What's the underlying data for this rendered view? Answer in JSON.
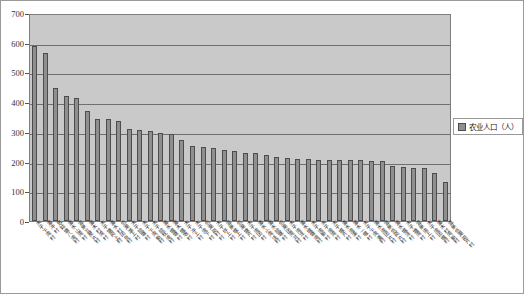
{
  "chart_data": {
    "type": "bar",
    "title": "",
    "xlabel": "",
    "ylabel": "",
    "ylim": [
      0,
      700
    ],
    "ytick_step": 100,
    "yticks": [
      0,
      100,
      200,
      300,
      400,
      500,
      600,
      700
    ],
    "grid": true,
    "legend_position": "right",
    "legend_entries": [
      "农业人口（人）"
    ],
    "series_name": "农业人口（人）",
    "bar_color": "#8f8f8f",
    "plot_background": "#c9c9c9",
    "categories": [
      "木子下湾村",
      "潘冲村",
      "思姑塘八湾村",
      "潘水山湾村",
      "温泉瓦屋片村",
      "潘木村湾村",
      "木子塘岗上村",
      "潘水村团良村",
      "低潮湖上村",
      "木子院塘村",
      "木子下湾新村",
      "木子院枕湾村",
      "潘水堰塘村",
      "潘木堰坂村",
      "木子冲上村",
      "木子湾下村",
      "低潮岗村村",
      "木子坪上村",
      "温泉堰上村",
      "低潮塘片村",
      "木子湾团村",
      "潘水小湾洼村",
      "潘水院塘村",
      "低潮团湾河村",
      "木子湾洼村",
      "潘水堰塘湾村",
      "木子湾新村",
      "木子湾湾村",
      "木子堰片村",
      "潘水湾溪村",
      "潘水一堰村",
      "木子下湾潘村",
      "潘水湾团片村",
      "温泉低岗片村",
      "潘水堰洼村",
      "木子塘湾村",
      "温泉湾上村",
      "木子湾团堰村",
      "潘木村湾新村",
      "温泉低潮岗片村"
    ],
    "values": [
      590,
      565,
      447,
      420,
      413,
      370,
      345,
      343,
      338,
      310,
      305,
      303,
      295,
      293,
      273,
      252,
      250,
      247,
      238,
      235,
      230,
      228,
      222,
      216,
      213,
      210,
      208,
      207,
      205,
      205,
      205,
      204,
      203,
      202,
      185,
      182,
      180,
      178,
      163,
      130
    ]
  },
  "legend": {
    "label": "农业人口（人）",
    "swatch_color": "#8f8f8f"
  }
}
